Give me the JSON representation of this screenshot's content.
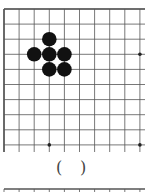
{
  "diagram": {
    "type": "go-board-fragment",
    "grid": {
      "x0": 4,
      "y0": 9,
      "spacing": 15.1,
      "cols": 10,
      "rows": 10
    },
    "stones": [
      {
        "color": "black",
        "col": 3,
        "row": 2
      },
      {
        "color": "black",
        "col": 2,
        "row": 3
      },
      {
        "color": "black",
        "col": 3,
        "row": 3
      },
      {
        "color": "black",
        "col": 4,
        "row": 3
      },
      {
        "color": "black",
        "col": 3,
        "row": 4
      },
      {
        "color": "black",
        "col": 4,
        "row": 4
      }
    ],
    "star_points": [
      {
        "col": 9,
        "row": 3
      },
      {
        "col": 3,
        "row": 9
      },
      {
        "col": 9,
        "row": 9
      }
    ],
    "answer_blank": {
      "open": "(",
      "close": ")"
    }
  }
}
